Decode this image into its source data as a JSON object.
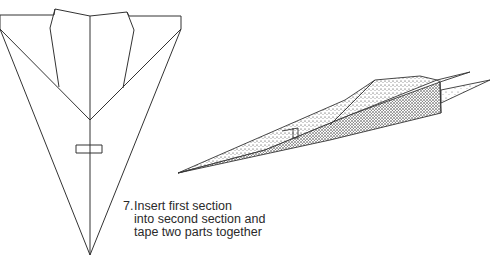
{
  "diagram": {
    "step": {
      "number": "7.",
      "lines": [
        "Insert first section",
        "into second section and",
        "tape two parts together"
      ]
    },
    "figures": [
      {
        "name": "flat-plane-top-view",
        "description": "Unfolded plane outline viewed from above with tape strip"
      },
      {
        "name": "assembled-plane-perspective",
        "description": "Stippled 3D view of the assembled plane"
      }
    ],
    "colors": {
      "line": "#333333",
      "stipple": "#222222",
      "background": "#ffffff"
    }
  }
}
